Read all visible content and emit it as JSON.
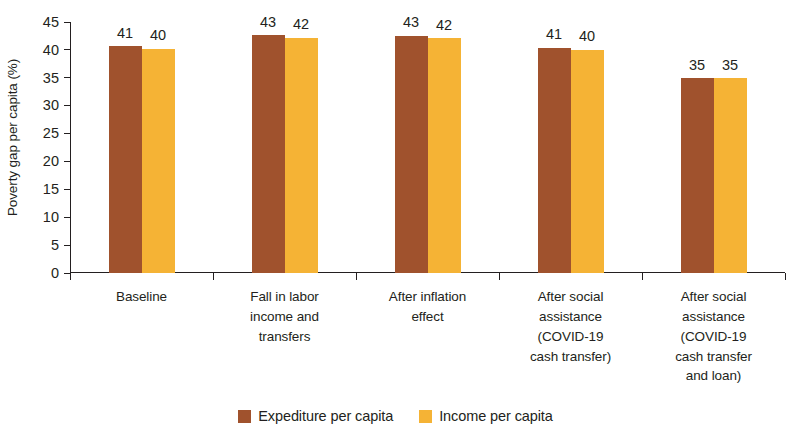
{
  "chart_data": {
    "type": "bar",
    "title": "",
    "xlabel": "",
    "ylabel": "Poverty gap per capita (%)",
    "ylim": [
      0,
      45
    ],
    "yticks": [
      0,
      5,
      10,
      15,
      20,
      25,
      30,
      35,
      40,
      45
    ],
    "grid": false,
    "legend_position": "bottom",
    "categories": [
      "Baseline",
      "Fall in labor income and transfers",
      "After inflation effect",
      "After social assistance (COVID-19 cash transfer)",
      "After social assistance (COVID-19 cash transfer and loan)"
    ],
    "category_lines": [
      [
        "Baseline"
      ],
      [
        "Fall in labor",
        "income and",
        "transfers"
      ],
      [
        "After inflation",
        "effect"
      ],
      [
        "After social",
        "assistance",
        "(COVID-19",
        "cash transfer)"
      ],
      [
        "After social",
        "assistance",
        "(COVID-19",
        "cash transfer",
        "and loan)"
      ]
    ],
    "series": [
      {
        "name": "Expediture per capita",
        "color": "#A0522D",
        "values": [
          41,
          43,
          43,
          41,
          35
        ],
        "exact_values": [
          40.7,
          42.6,
          42.5,
          40.4,
          34.9
        ]
      },
      {
        "name": "Income per capita",
        "color": "#F5B335",
        "values": [
          40,
          42,
          42,
          40,
          35
        ],
        "exact_values": [
          40.2,
          42.2,
          42.1,
          40.0,
          34.9
        ]
      }
    ]
  },
  "colors": {
    "expenditure": "#A0522D",
    "income": "#F5B335",
    "axis": "#231f20",
    "text": "#231f20",
    "background": "#ffffff"
  }
}
